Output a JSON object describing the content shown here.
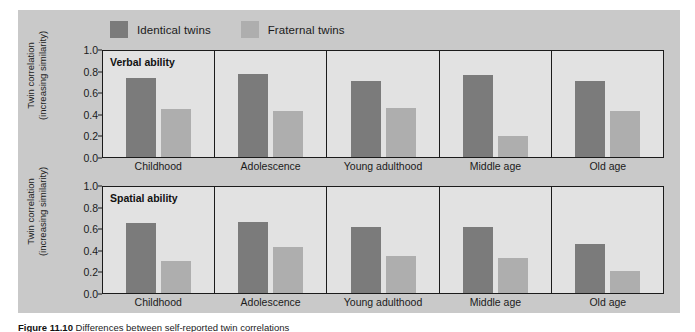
{
  "figure": {
    "caption_prefix": "Figure 11.10",
    "caption_text": "Differences between self-reported twin correlations",
    "background_color": "#c9c9c9",
    "plot_background_color": "#e2e2e2"
  },
  "legend": {
    "position": "top",
    "entries": [
      {
        "label": "Identical twins",
        "color": "#7b7b7b"
      },
      {
        "label": "Fraternal twins",
        "color": "#aeaeae"
      }
    ]
  },
  "axis": {
    "ylabel_line1": "Twin correlation",
    "ylabel_line2": "(increasing similarity)",
    "ticks": [
      "1.0",
      "0.8",
      "0.6",
      "0.4",
      "0.2",
      "0.0"
    ],
    "ymin": 0.0,
    "ymax": 1.0
  },
  "categories": [
    "Childhood",
    "Adolescence",
    "Young adulthood",
    "Middle age",
    "Old age"
  ],
  "chart_data": {
    "type": "bar",
    "title": "",
    "xlabel": "",
    "ylabel": "Twin correlation (increasing similarity)",
    "ylim": [
      0.0,
      1.0
    ],
    "grid": false,
    "legend_position": "top",
    "categories": [
      "Childhood",
      "Adolescence",
      "Young adulthood",
      "Middle age",
      "Old age"
    ],
    "panels": [
      {
        "title": "Verbal ability",
        "series": [
          {
            "name": "Identical twins",
            "color": "#7b7b7b",
            "values": [
              0.73,
              0.77,
              0.7,
              0.76,
              0.7
            ]
          },
          {
            "name": "Fraternal twins",
            "color": "#aeaeae",
            "values": [
              0.44,
              0.43,
              0.45,
              0.19,
              0.43
            ]
          }
        ]
      },
      {
        "title": "Spatial ability",
        "series": [
          {
            "name": "Identical twins",
            "color": "#7b7b7b",
            "values": [
              0.65,
              0.66,
              0.61,
              0.61,
              0.45
            ]
          },
          {
            "name": "Fraternal twins",
            "color": "#aeaeae",
            "values": [
              0.3,
              0.43,
              0.34,
              0.32,
              0.2
            ]
          }
        ]
      }
    ]
  }
}
